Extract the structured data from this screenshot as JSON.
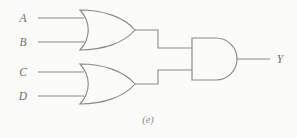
{
  "figure": {
    "caption": "(e)",
    "background_color": "#fbfbfa",
    "line_color": "#8a8a8a",
    "label_color": "#6f6f6f",
    "caption_color": "#8e8e8e"
  },
  "inputs": [
    {
      "id": "A",
      "label": "A",
      "gate": "or-gate-top",
      "wire_y": 18
    },
    {
      "id": "B",
      "label": "B",
      "gate": "or-gate-top",
      "wire_y": 42
    },
    {
      "id": "C",
      "label": "C",
      "gate": "or-gate-bottom",
      "wire_y": 72
    },
    {
      "id": "D",
      "label": "D",
      "gate": "or-gate-bottom",
      "wire_y": 96
    }
  ],
  "outputs": [
    {
      "id": "Y",
      "label": "Y",
      "gate": "and-gate",
      "wire_y": 59
    }
  ],
  "gates": [
    {
      "id": "or-gate-top",
      "type": "OR",
      "inputs": [
        "A",
        "B"
      ],
      "output": "or-top-out"
    },
    {
      "id": "or-gate-bottom",
      "type": "OR",
      "inputs": [
        "C",
        "D"
      ],
      "output": "or-bottom-out"
    },
    {
      "id": "and-gate",
      "type": "AND",
      "inputs": [
        "or-top-out",
        "or-bottom-out"
      ],
      "output": "Y"
    }
  ],
  "logic": {
    "expression": "Y = (A + B) · (C + D)"
  }
}
